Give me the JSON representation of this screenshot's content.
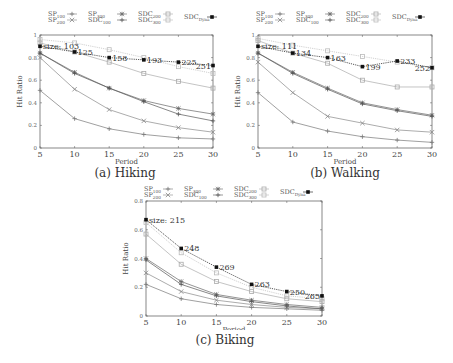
{
  "legend": {
    "entries": [
      {
        "key": "SP_100",
        "base": "SP",
        "sub": "100",
        "marker": "plus",
        "color": "#777777"
      },
      {
        "key": "SP_200",
        "base": "SP",
        "sub": "200",
        "marker": "x",
        "color": "#888888"
      },
      {
        "key": "SP_300",
        "base": "SP",
        "sub": "300",
        "marker": "star",
        "color": "#666666"
      },
      {
        "key": "SDC_100",
        "base": "SDC",
        "sub": "100",
        "marker": "plus",
        "color": "#555555"
      },
      {
        "key": "SDC_200",
        "base": "SDC",
        "sub": "200",
        "marker": "square-open",
        "color": "#aaaaaa"
      },
      {
        "key": "SDC_300",
        "base": "SDC",
        "sub": "300",
        "marker": "square-open",
        "color": "#bbbbbb"
      },
      {
        "key": "SDC_Dyna",
        "base": "SDC",
        "sub": "Dyna",
        "marker": "square-filled",
        "color": "#111111"
      }
    ]
  },
  "chart_data": [
    {
      "id": "hiking",
      "type": "line",
      "title": "(a) Hiking",
      "xlabel": "Period",
      "ylabel": "Hit Ratio",
      "x": [
        5,
        10,
        15,
        20,
        25,
        30
      ],
      "xticks": [
        "5",
        "10",
        "15",
        "20",
        "25",
        "30"
      ],
      "yticks": [
        "0",
        "0.2",
        "0.4",
        "0.6",
        "0.8",
        "1"
      ],
      "ylim": [
        0,
        1
      ],
      "grid": false,
      "legend_position": "top",
      "series": [
        {
          "name": "SP_100",
          "values": [
            0.51,
            0.26,
            0.17,
            0.12,
            0.09,
            0.08
          ]
        },
        {
          "name": "SP_200",
          "values": [
            0.8,
            0.52,
            0.34,
            0.24,
            0.18,
            0.14
          ]
        },
        {
          "name": "SP_300",
          "values": [
            0.84,
            0.67,
            0.53,
            0.42,
            0.35,
            0.3
          ]
        },
        {
          "name": "SDC_100",
          "values": [
            0.84,
            0.66,
            0.53,
            0.41,
            0.3,
            0.24
          ]
        },
        {
          "name": "SDC_200",
          "values": [
            0.93,
            0.85,
            0.76,
            0.66,
            0.59,
            0.53
          ]
        },
        {
          "name": "SDC_300",
          "values": [
            0.96,
            0.93,
            0.87,
            0.8,
            0.72,
            0.66
          ]
        },
        {
          "name": "SDC_Dyna",
          "values": [
            0.9,
            0.85,
            0.8,
            0.78,
            0.76,
            0.73
          ]
        }
      ],
      "annotations": [
        "size: 103",
        "125",
        "158",
        "193",
        "225",
        "251"
      ]
    },
    {
      "id": "walking",
      "type": "line",
      "title": "(b) Walking",
      "xlabel": "Period",
      "ylabel": "Hit Ratio",
      "x": [
        5,
        10,
        15,
        20,
        25,
        30
      ],
      "xticks": [
        "5",
        "10",
        "15",
        "20",
        "25",
        "30"
      ],
      "yticks": [
        "0",
        "0.2",
        "0.4",
        "0.6",
        "0.8",
        "1"
      ],
      "ylim": [
        0,
        1
      ],
      "grid": false,
      "legend_position": "top",
      "series": [
        {
          "name": "SP_100",
          "values": [
            0.49,
            0.23,
            0.15,
            0.1,
            0.07,
            0.05
          ]
        },
        {
          "name": "SP_200",
          "values": [
            0.76,
            0.49,
            0.28,
            0.22,
            0.16,
            0.14
          ]
        },
        {
          "name": "SP_300",
          "values": [
            0.84,
            0.67,
            0.53,
            0.4,
            0.34,
            0.29
          ]
        },
        {
          "name": "SDC_100",
          "values": [
            0.84,
            0.66,
            0.52,
            0.39,
            0.33,
            0.28
          ]
        },
        {
          "name": "SDC_200",
          "values": [
            0.95,
            0.84,
            0.75,
            0.6,
            0.54,
            0.54
          ]
        },
        {
          "name": "SDC_300",
          "values": [
            0.97,
            0.91,
            0.86,
            0.81,
            0.76,
            0.71
          ]
        },
        {
          "name": "SDC_Dyna",
          "values": [
            0.9,
            0.84,
            0.8,
            0.72,
            0.77,
            0.71
          ]
        }
      ],
      "annotations": [
        "size: 111",
        "134",
        "163",
        "199",
        "233",
        "252"
      ]
    },
    {
      "id": "biking",
      "type": "line",
      "title": "(c) Biking",
      "xlabel": "Period",
      "ylabel": "Hit Ratio",
      "x": [
        5,
        10,
        15,
        20,
        25,
        30
      ],
      "xticks": [
        "5",
        "10",
        "15",
        "20",
        "25",
        "30"
      ],
      "yticks": [
        "0",
        "0.2",
        "0.4",
        "0.6",
        "0.8"
      ],
      "ylim": [
        0,
        0.8
      ],
      "grid": false,
      "legend_position": "top",
      "series": [
        {
          "name": "SP_100",
          "values": [
            0.22,
            0.12,
            0.08,
            0.06,
            0.05,
            0.04
          ]
        },
        {
          "name": "SP_200",
          "values": [
            0.3,
            0.17,
            0.11,
            0.08,
            0.06,
            0.05
          ]
        },
        {
          "name": "SP_300",
          "values": [
            0.4,
            0.24,
            0.15,
            0.11,
            0.08,
            0.06
          ]
        },
        {
          "name": "SDC_100",
          "values": [
            0.39,
            0.22,
            0.14,
            0.1,
            0.07,
            0.05
          ]
        },
        {
          "name": "SDC_200",
          "values": [
            0.57,
            0.36,
            0.24,
            0.17,
            0.12,
            0.1
          ]
        },
        {
          "name": "SDC_300",
          "values": [
            0.65,
            0.44,
            0.3,
            0.2,
            0.14,
            0.12
          ]
        },
        {
          "name": "SDC_Dyna",
          "values": [
            0.67,
            0.47,
            0.34,
            0.22,
            0.17,
            0.14
          ]
        }
      ],
      "annotations": [
        "size: 215",
        "248",
        "269",
        "263",
        "250",
        "265"
      ]
    }
  ],
  "captions": {
    "hiking": "(a) Hiking",
    "walking": "(b) Walking",
    "biking": "(c) Biking"
  }
}
